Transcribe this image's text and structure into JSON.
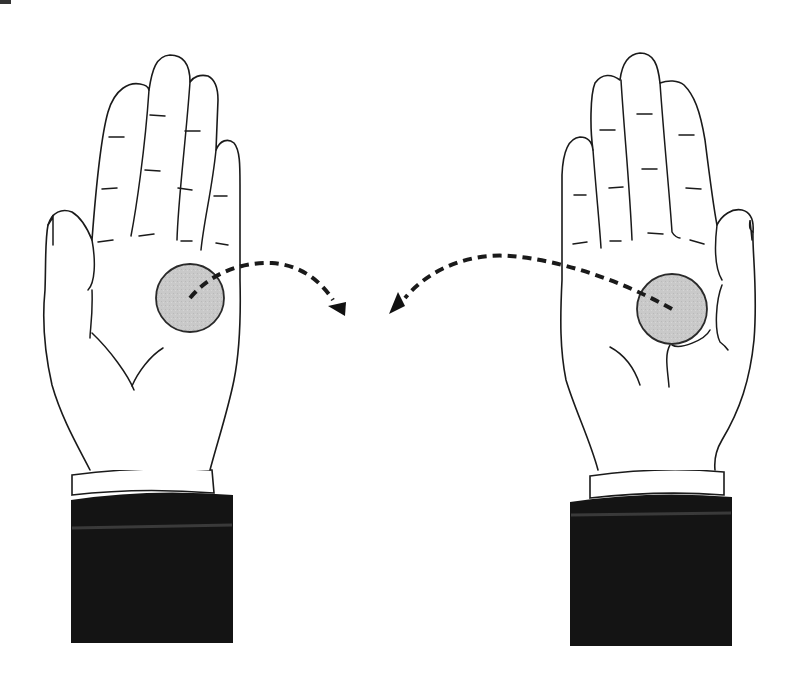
{
  "figure": {
    "colors": {
      "outline": "#1a1a1a",
      "coin_fill": "#c8c8c8",
      "sleeve": "#141414",
      "cuff": "#ffffff",
      "background": "#ffffff"
    },
    "left_hand": {
      "label": "left-hand",
      "coin": {
        "cx": 190,
        "cy": 298,
        "r": 34
      },
      "arrow": {
        "from": [
          190,
          298
        ],
        "to": [
          340,
          312
        ],
        "direction": "right"
      }
    },
    "right_hand": {
      "label": "right-hand",
      "coin": {
        "cx": 672,
        "cy": 309,
        "r": 35
      },
      "arrow": {
        "from": [
          672,
          309
        ],
        "to": [
          390,
          312
        ],
        "direction": "left"
      }
    }
  }
}
